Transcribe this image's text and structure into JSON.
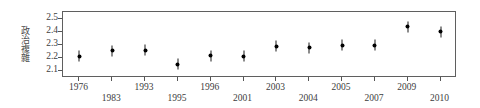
{
  "chart_data": {
    "type": "scatter",
    "title": "",
    "xlabel": "",
    "ylabel": "政治複雜",
    "categories": [
      "1976",
      "1983",
      "1993",
      "1995",
      "1996",
      "2001",
      "2003",
      "2004",
      "2005",
      "2007",
      "2009",
      "2010"
    ],
    "values": [
      2.215,
      2.255,
      2.26,
      2.155,
      2.22,
      2.215,
      2.29,
      2.28,
      2.3,
      2.3,
      2.44,
      2.4
    ],
    "error_bars": [
      0.035,
      0.035,
      0.03,
      0.03,
      0.03,
      0.03,
      0.03,
      2.28,
      0.03,
      0.03,
      0.035,
      0.03
    ],
    "ylim": [
      2.05,
      2.55
    ],
    "yticks": [
      2.5,
      2.4,
      2.3,
      2.2,
      2.1
    ],
    "ytick_labels": [
      "2.5",
      "2.4",
      "2.3",
      "2.2",
      "2.1"
    ],
    "grid": false,
    "legend": null,
    "marker": "dot-with-vertical-error-bar",
    "marker_color": "#000000",
    "frame_color": "#5f5f5f",
    "background": "#ffffff",
    "xtick_label_stagger": [
      "top",
      "bottom",
      "top",
      "bottom",
      "top",
      "bottom",
      "top",
      "bottom",
      "top",
      "bottom",
      "top",
      "bottom"
    ]
  }
}
